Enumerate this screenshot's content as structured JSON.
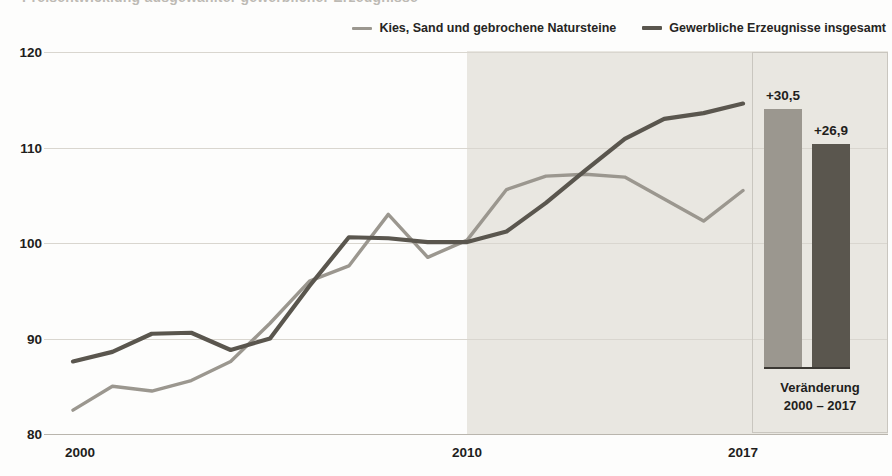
{
  "page": {
    "title_cut_off": "Preisentwicklung ausgewählter gewerblicher Erzeugnisse"
  },
  "legend": {
    "items": [
      {
        "label": "Kies, Sand und gebrochene Natursteine",
        "color": "#9b978f",
        "swatch_name": "legend-line-swatch-kies"
      },
      {
        "label": "Gewerbliche Erzeugnisse insgesamt",
        "color": "#5a564e",
        "swatch_name": "legend-line-swatch-gewerblich"
      }
    ]
  },
  "side_panel": {
    "caption_line1": "Veränderung",
    "caption_line2": "2000 – 2017",
    "bars": [
      {
        "label": "+30,5",
        "value": 30.5,
        "color": "#9b978f",
        "series": "Kies, Sand und gebrochene Natursteine"
      },
      {
        "label": "+26,9",
        "value": 26.9,
        "color": "#5a564e",
        "series": "Gewerbliche Erzeugnisse insgesamt"
      }
    ]
  },
  "chart_data": {
    "type": "line",
    "title": "Preisentwicklung ausgewählter gewerblicher Erzeugnisse",
    "xlabel": "",
    "ylabel": "",
    "ylim": [
      80,
      120
    ],
    "yticks": [
      80,
      90,
      100,
      110,
      120
    ],
    "ytick_labels": [
      "80",
      "90",
      "100",
      "110",
      "120"
    ],
    "xlim": [
      2000,
      2017
    ],
    "xticks": [
      2000,
      2010,
      2017
    ],
    "xtick_labels": [
      "2000",
      "2010",
      "2017"
    ],
    "grid": true,
    "legend_position": "top-right",
    "shaded_region": {
      "from": 2010,
      "to": 2017,
      "color": "#e9e7e1"
    },
    "x": [
      2000,
      2001,
      2002,
      2003,
      2004,
      2005,
      2006,
      2007,
      2008,
      2009,
      2010,
      2011,
      2012,
      2013,
      2014,
      2015,
      2016,
      2017
    ],
    "series": [
      {
        "name": "Kies, Sand und gebrochene Natursteine",
        "color": "#9b978f",
        "values": [
          82.5,
          85.0,
          84.5,
          85.6,
          87.6,
          91.6,
          96.0,
          97.6,
          103.0,
          98.5,
          100.3,
          105.6,
          107.0,
          107.2,
          106.9,
          104.6,
          102.3,
          105.5
        ]
      },
      {
        "name": "Gewerbliche Erzeugnisse insgesamt",
        "color": "#5a564e",
        "values": [
          87.6,
          88.6,
          90.5,
          90.6,
          88.8,
          90.0,
          95.5,
          100.6,
          100.5,
          100.1,
          100.1,
          101.2,
          104.2,
          107.6,
          110.9,
          113.0,
          113.6,
          114.6
        ]
      }
    ],
    "annotations": [
      {
        "text": "+30,5",
        "series": "Kies, Sand und gebrochene Natursteine"
      },
      {
        "text": "+26,9",
        "series": "Gewerbliche Erzeugnisse insgesamt"
      }
    ]
  }
}
